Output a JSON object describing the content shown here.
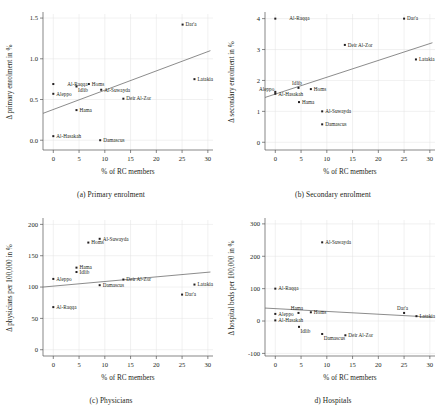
{
  "figure": {
    "xlabel": "% of RC members",
    "x_ticks": [
      "0",
      "5",
      "10",
      "15",
      "20",
      "25",
      "30"
    ]
  },
  "panels": [
    {
      "id": "a",
      "caption": "(a) Primary enrolment",
      "ylabel": "Δ primary enrolment in %",
      "y_ticks": [
        "0.0",
        "0.5",
        "1.0",
        "1.5"
      ]
    },
    {
      "id": "b",
      "caption": "(b) Secondary enrolment",
      "ylabel": "Δ secondary enrolment in %",
      "y_ticks": [
        "0",
        "1",
        "2",
        "3",
        "4"
      ]
    },
    {
      "id": "c",
      "caption": "(c) Physicians",
      "ylabel": "Δ physicians per 100,000 in %",
      "y_ticks": [
        "0",
        "50",
        "100",
        "150",
        "200"
      ]
    },
    {
      "id": "d",
      "caption": "d) Hospitals",
      "ylabel": "Δ hospital beds per 100,000 in %",
      "y_ticks": [
        "-100",
        "0",
        "100",
        "200",
        "300"
      ]
    }
  ],
  "chart_data": [
    {
      "type": "scatter",
      "panel": "a",
      "title": "(a) Primary enrolment",
      "xlabel": "% of RC members",
      "ylabel": "Δ primary enrolment in %",
      "xlim": [
        -2,
        31
      ],
      "ylim": [
        -0.12,
        1.55
      ],
      "grid": true,
      "points": [
        {
          "label": "Al-Hasakah",
          "x": 0.0,
          "y": 0.05,
          "lpos": "right"
        },
        {
          "label": "Aleppo",
          "x": 0.0,
          "y": 0.57,
          "lpos": "right"
        },
        {
          "label": "Al-Raqqa",
          "x": 0.0,
          "y": 0.69,
          "lpos": "right-far"
        },
        {
          "label": "Idlib",
          "x": 4.5,
          "y": 0.66,
          "lpos": "below"
        },
        {
          "label": "Hama",
          "x": 4.5,
          "y": 0.37,
          "lpos": "right"
        },
        {
          "label": "Homs",
          "x": 6.9,
          "y": 0.69,
          "lpos": "right"
        },
        {
          "label": "Damascus",
          "x": 9.1,
          "y": 0.0,
          "lpos": "right"
        },
        {
          "label": "Al-Suwayda",
          "x": 9.3,
          "y": 0.62,
          "lpos": "right"
        },
        {
          "label": "Deir Al-Zor",
          "x": 13.6,
          "y": 0.51,
          "lpos": "right"
        },
        {
          "label": "Dar'a",
          "x": 25.1,
          "y": 1.42,
          "lpos": "right"
        },
        {
          "label": "Latakia",
          "x": 27.4,
          "y": 0.75,
          "lpos": "right"
        }
      ],
      "fit_line": {
        "x0": -2,
        "y0": 0.33,
        "x1": 30.5,
        "y1": 1.1
      }
    },
    {
      "type": "scatter",
      "panel": "b",
      "title": "(b) Secondary enrolment",
      "xlabel": "% of RC members",
      "ylabel": "Δ secondary enrolment in %",
      "xlim": [
        -2,
        31
      ],
      "ylim": [
        -0.25,
        4.15
      ],
      "grid": true,
      "points": [
        {
          "label": "Al-Raqqa",
          "x": 0.0,
          "y": 4.0,
          "lpos": "right-far"
        },
        {
          "label": "Aleppo",
          "x": 0.0,
          "y": 1.63,
          "lpos": "left-over"
        },
        {
          "label": "Al-Hasakah",
          "x": 0.0,
          "y": 1.57,
          "lpos": "right"
        },
        {
          "label": "Idlib",
          "x": 4.5,
          "y": 1.76,
          "lpos": "above"
        },
        {
          "label": "Hama",
          "x": 4.6,
          "y": 1.3,
          "lpos": "right"
        },
        {
          "label": "Homs",
          "x": 6.9,
          "y": 1.72,
          "lpos": "right"
        },
        {
          "label": "Al-Suwayda",
          "x": 9.1,
          "y": 1.0,
          "lpos": "right"
        },
        {
          "label": "Damascus",
          "x": 9.1,
          "y": 0.58,
          "lpos": "right"
        },
        {
          "label": "Deir Al-Zor",
          "x": 13.5,
          "y": 3.15,
          "lpos": "right"
        },
        {
          "label": "Dar'a",
          "x": 25.0,
          "y": 4.0,
          "lpos": "right"
        },
        {
          "label": "Latakia",
          "x": 27.3,
          "y": 2.68,
          "lpos": "right"
        }
      ],
      "fit_line": {
        "x0": -2,
        "y0": 1.45,
        "x1": 30.5,
        "y1": 3.22
      }
    },
    {
      "type": "scatter",
      "panel": "c",
      "title": "(c) Physicians",
      "xlabel": "% of RC members",
      "ylabel": "Δ physicians per 100,000 in %",
      "xlim": [
        -2,
        31
      ],
      "ylim": [
        -10,
        207
      ],
      "grid": true,
      "points": [
        {
          "label": "Al-Raqqa",
          "x": 0.0,
          "y": 68,
          "lpos": "right"
        },
        {
          "label": "Aleppo",
          "x": 0.0,
          "y": 113,
          "lpos": "right"
        },
        {
          "label": "Idlib",
          "x": 4.5,
          "y": 124,
          "lpos": "right"
        },
        {
          "label": "Hama",
          "x": 4.5,
          "y": 131,
          "lpos": "right"
        },
        {
          "label": "Homs",
          "x": 6.8,
          "y": 171,
          "lpos": "right"
        },
        {
          "label": "Al-Suwayda",
          "x": 9.0,
          "y": 177,
          "lpos": "right"
        },
        {
          "label": "Damascus",
          "x": 9.0,
          "y": 103,
          "lpos": "right"
        },
        {
          "label": "Deir Al-Zor",
          "x": 13.6,
          "y": 112,
          "lpos": "right"
        },
        {
          "label": "Dar'a",
          "x": 25.0,
          "y": 88,
          "lpos": "right"
        },
        {
          "label": "Latakia",
          "x": 27.4,
          "y": 104,
          "lpos": "right"
        }
      ],
      "fit_line": {
        "x0": -2,
        "y0": 100,
        "x1": 30.5,
        "y1": 124
      }
    },
    {
      "type": "scatter",
      "panel": "d",
      "title": "d) Hospitals",
      "xlabel": "% of RC members",
      "ylabel": "Δ hospital beds per 100,000 in %",
      "xlim": [
        -2,
        31
      ],
      "ylim": [
        -108,
        312
      ],
      "grid": true,
      "points": [
        {
          "label": "Al-Raqqa",
          "x": 0.0,
          "y": 100,
          "lpos": "right"
        },
        {
          "label": "Aleppo",
          "x": 0.0,
          "y": 22,
          "lpos": "right"
        },
        {
          "label": "Al-Hasakah",
          "x": 0.0,
          "y": 2,
          "lpos": "right"
        },
        {
          "label": "Hama",
          "x": 4.5,
          "y": 25,
          "lpos": "above"
        },
        {
          "label": "Idlib",
          "x": 4.6,
          "y": -18,
          "lpos": "below"
        },
        {
          "label": "Homs",
          "x": 6.9,
          "y": 27,
          "lpos": "right"
        },
        {
          "label": "Al-Suwayda",
          "x": 9.1,
          "y": 243,
          "lpos": "right"
        },
        {
          "label": "Damascus",
          "x": 9.1,
          "y": -40,
          "lpos": "below"
        },
        {
          "label": "Deir Al-Zor",
          "x": 13.6,
          "y": -44,
          "lpos": "right"
        },
        {
          "label": "Dar'a",
          "x": 25.0,
          "y": 25,
          "lpos": "above"
        },
        {
          "label": "Latakia",
          "x": 27.4,
          "y": 15,
          "lpos": "right"
        }
      ],
      "fit_line": {
        "x0": -2,
        "y0": 40,
        "x1": 30.5,
        "y1": 12
      }
    }
  ]
}
